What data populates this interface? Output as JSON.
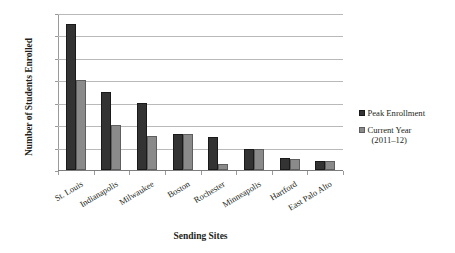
{
  "chart_data": {
    "type": "bar",
    "title": "",
    "xlabel": "Sending Sites",
    "ylabel": "Number of Students Enrolled",
    "ylim": [
      0,
      14000
    ],
    "yticks": [
      "0",
      "2,000",
      "4,000",
      "6,000",
      "8,000",
      "10,000",
      "12,000",
      "14,000"
    ],
    "ytick_values": [
      0,
      2000,
      4000,
      6000,
      8000,
      10000,
      12000,
      14000
    ],
    "grid": true,
    "legend_position": "right",
    "categories": [
      "St. Louis",
      "Indianapolis",
      "Milwaukee",
      "Boston",
      "Rochester",
      "Minneapolis",
      "Hartford",
      "East Palo Alto"
    ],
    "series": [
      {
        "name": "Peak Enrollment",
        "color": "#333333",
        "values": [
          13000,
          7000,
          6000,
          3200,
          2900,
          1900,
          1050,
          830
        ]
      },
      {
        "name": "Current Year (2011–12)",
        "color": "#8a8a8a",
        "values": [
          8000,
          4000,
          3000,
          3200,
          500,
          1880,
          950,
          830
        ]
      }
    ]
  },
  "legend": {
    "items": [
      {
        "label": "Peak Enrollment",
        "sublabel": ""
      },
      {
        "label": "Current Year",
        "sublabel": "(2011–12)"
      }
    ]
  }
}
